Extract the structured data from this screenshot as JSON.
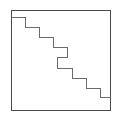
{
  "figure": {
    "type": "line-drawing",
    "canvas": {
      "width": 120,
      "height": 117,
      "background_color": "#ffffff"
    },
    "frame": {
      "name": "square-border",
      "x": 11,
      "y": 10,
      "width": 99,
      "height": 100,
      "stroke_color": "#4a4a4a",
      "stroke_width": 1,
      "fill_color": "none"
    },
    "staircase": {
      "name": "staircase-polyline",
      "stroke_color": "#6b6b6b",
      "stroke_width": 1.6,
      "fill_color": "none",
      "description": "Descending staircase from the left frame edge to the right frame edge with one reversed (backward) step near the center",
      "points": [
        [
          11,
          17
        ],
        [
          25,
          17
        ],
        [
          25,
          27
        ],
        [
          39,
          27
        ],
        [
          39,
          37
        ],
        [
          53,
          37
        ],
        [
          53,
          47
        ],
        [
          67,
          47
        ],
        [
          67,
          57
        ],
        [
          57,
          57
        ],
        [
          57,
          68
        ],
        [
          72,
          68
        ],
        [
          72,
          78
        ],
        [
          86,
          78
        ],
        [
          86,
          88
        ],
        [
          100,
          88
        ],
        [
          100,
          97
        ],
        [
          110,
          97
        ]
      ]
    }
  }
}
